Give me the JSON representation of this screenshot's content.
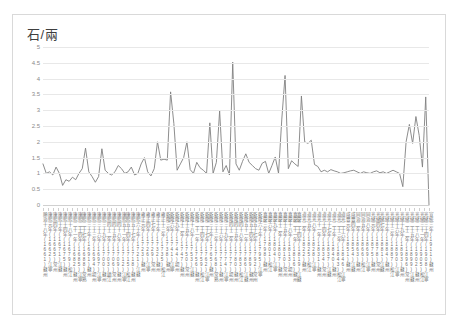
{
  "chart_title": "石/兩",
  "axis": {
    "y_ticks": [
      "0",
      "0.5",
      "1",
      "1.5",
      "2",
      "2.5",
      "3",
      "3.5",
      "4",
      "4.5",
      "5"
    ],
    "y_min": 0,
    "y_max": 5,
    "y_step": 0.5,
    "grid": true,
    "x_axis_label": "",
    "y_axis_label": "石/兩"
  },
  "colors": {
    "line": "#808080",
    "grid": "#e8e8e8",
    "frame": "#d9d9d9",
    "tick_text": "#8a8a8a",
    "xlabel_text": "#6f6f6f",
    "background": "#ffffff"
  },
  "chart_data": {
    "type": "line",
    "title": "石/兩",
    "subtitle": "",
    "xlabel": "",
    "ylabel": "石/兩",
    "ylim": [
      0,
      5
    ],
    "xlim": [
      0,
      120
    ],
    "grid": true,
    "legend": false,
    "legend_position": "none",
    "series": [
      {
        "name": "米價",
        "values": [
          1.3,
          1.0,
          1.05,
          0.95,
          1.2,
          1.0,
          0.62,
          0.8,
          0.75,
          0.88,
          0.8,
          1.0,
          1.15,
          1.8,
          1.05,
          0.9,
          0.72,
          0.9,
          1.78,
          1.1,
          1.0,
          0.95,
          1.05,
          1.25,
          1.15,
          1.0,
          1.05,
          1.2,
          0.95,
          1.0,
          1.3,
          1.5,
          1.05,
          0.92,
          1.15,
          2.0,
          1.42,
          1.45,
          1.42,
          3.58,
          2.58,
          1.1,
          1.3,
          1.5,
          2.0,
          1.12,
          1.0,
          1.35,
          1.18,
          1.1,
          1.0,
          2.6,
          1.0,
          1.35,
          2.98,
          1.05,
          1.25,
          0.95,
          4.52,
          1.3,
          1.1,
          1.38,
          1.62,
          1.35,
          1.25,
          1.15,
          1.1,
          1.32,
          1.38,
          1.0,
          1.25,
          1.52,
          1.0,
          2.72,
          4.1,
          1.15,
          1.4,
          1.3,
          1.22,
          3.45,
          2.0,
          1.95,
          2.05,
          1.28,
          1.22,
          1.05,
          1.1,
          1.05,
          1.12,
          1.08,
          1.05,
          1.0,
          1.02,
          1.05,
          1.08,
          1.1,
          1.05,
          1.0,
          1.05,
          1.02,
          1.0,
          1.05,
          1.08,
          1.02,
          1.05,
          1.0,
          1.05,
          1.1,
          1.05,
          1.0,
          0.58,
          2.0,
          2.55,
          1.95,
          2.8,
          2.2,
          1.2,
          3.42,
          0.0
        ]
      }
    ]
  },
  "x_labels": [
    "順治十八年(1661)蘇州",
    "康熙元年(1662)江寧",
    "康熙四年(1665)常州",
    "康熙十年(1671)江蘇",
    "康熙十四年(1675)蘇州",
    "康熙十八年(1679)松江",
    "康熙二十一年(1682)蘇州",
    "康熙二十四年(1685)江寧",
    "康熙二十七年(1688)常熟",
    "康熙三十年(1691)蘇州",
    "康熙三十三年(1694)揚州",
    "康熙三十六年(1697)江寧",
    "康熙三十九年(1700)蘇州",
    "康熙四十二年(1703)鎮江",
    "康熙四十五年(1706)常州",
    "康熙四十八年(1709)蘇州",
    "康熙五十一年(1712)江寧",
    "康熙五十四年(1715)松江",
    "康熙五十七年(1718)蘇州",
    "康熙六十年(1721)江蘇",
    "雍正元年(1723)蘇州",
    "雍正四年(1726)江寧",
    "雍正七年(1729)常州",
    "雍正十年(1732)蘇州",
    "雍正十三年(1735)松江",
    "乾隆三年(1738)蘇州",
    "乾隆六年(1741)江寧",
    "乾隆九年(1744)揚州",
    "乾隆十二年(1747)蘇州",
    "乾隆十五年(1750)常州",
    "乾隆十八年(1753)江蘇",
    "乾隆二十一年(1756)蘇州",
    "乾隆二十四年(1759)松江",
    "乾隆二十七年(1762)江寧",
    "乾隆三十年(1765)蘇州",
    "乾隆三十三年(1768)常熟",
    "乾隆三十六年(1771)蘇州",
    "乾隆三十九年(1774)江寧",
    "乾隆四十二年(1777)揚州",
    "乾隆四十五年(1780)蘇州",
    "乾隆四十八年(1783)松江",
    "乾隆五十一年(1786)江蘇",
    "乾隆五十四年(1789)蘇州",
    "乾隆五十七年(1792)常州",
    "乾隆六十年(1795)江寧",
    "嘉慶三年(1798)蘇州",
    "嘉慶六年(1801)松江",
    "嘉慶九年(1804)江寧",
    "嘉慶十二年(1807)蘇州",
    "嘉慶十五年(1810)常州",
    "嘉慶十八年(1813)揚州",
    "嘉慶二十一年(1816)蘇州",
    "嘉慶二十四年(1819)江蘇",
    "道光二年(1822)蘇州",
    "道光五年(1825)松江",
    "道光八年(1828)江寧",
    "道光十一年(1831)蘇州",
    "道光十四年(1834)常州",
    "道光十七年(1837)江蘇",
    "道光二十年(1840)蘇州",
    "道光二十三年(1843)松江",
    "道光二十六年(1846)江寧",
    "咸豐元年(1851)蘇州",
    "咸豐四年(1854)江蘇",
    "同治二年(1863)蘇州",
    "同治五年(1866)松江",
    "同治八年(1869)江寧",
    "光緒元年(1875)蘇州",
    "光緒四年(1878)常州",
    "光緒七年(1881)江蘇",
    "光緒十年(1884)蘇州",
    "光緒十三年(1887)松江",
    "光緒十六年(1890)江寧",
    "光緒十九年(1893)蘇州",
    "光緒二十二年(1896)常州",
    "光緒二十五年(1899)江蘇",
    "光緒二十八年(1902)蘇州",
    "光緒三十一年(1905)松江",
    "光緒三十四年(1908)江寧",
    "宣統三年(1911)蘇州"
  ]
}
